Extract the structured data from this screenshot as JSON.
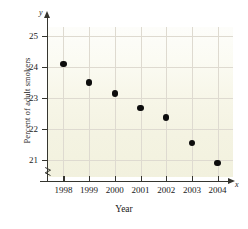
{
  "chart_data": {
    "type": "scatter",
    "title": "",
    "xlabel": "Year",
    "ylabel": "Percent of adult smokers",
    "categories": [
      "1998",
      "1999",
      "2000",
      "2001",
      "2002",
      "2003",
      "2004"
    ],
    "x": [
      1998,
      1999,
      2000,
      2001,
      2002,
      2003,
      2004
    ],
    "values": [
      24.1,
      23.5,
      23.15,
      22.68,
      22.37,
      21.55,
      20.9
    ],
    "xlim": [
      1997.4,
      2004.6
    ],
    "ylim": [
      20.45,
      25.3
    ],
    "yticks": [
      21,
      22,
      23,
      24,
      25
    ],
    "ytick_labels": [
      "21",
      "22",
      "23",
      "24",
      "25"
    ],
    "xtick_labels": [
      "1998",
      "1999",
      "2000",
      "2001",
      "2002",
      "2003",
      "2004"
    ],
    "grid": true,
    "legend": null,
    "axis_letters": {
      "x": "x",
      "y": "y"
    },
    "marker": "filled-circle",
    "colors": {
      "marker": "#0d0d0d",
      "axis": "#35352f",
      "grid": "#dedad0",
      "panel_background": "#f5f4e6",
      "text": "#1a1a1a"
    },
    "annotations": [
      "axis-break-on-y-axis"
    ]
  }
}
